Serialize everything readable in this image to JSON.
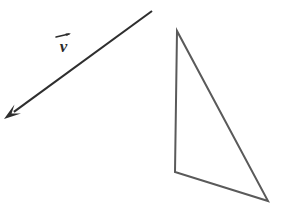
{
  "figure": {
    "background_color": "#ffffff",
    "width": 282,
    "height": 215,
    "vector": {
      "name": "v",
      "label_text": "v",
      "label_accent": "right-arrow-overbar",
      "label_position": {
        "x": 55,
        "y": 31
      },
      "tail": {
        "x": 152,
        "y": 11
      },
      "head": {
        "x": 4,
        "y": 119
      },
      "stroke_color": "#2e2e2e",
      "stroke_width": 2.1,
      "arrowhead": "solid-filled-triangle",
      "arrowhead_length": 17,
      "arrowhead_width": 11
    },
    "triangle": {
      "name": "triangle",
      "stroke_color": "#5a5a5a",
      "stroke_width": 2.0,
      "fill": "none",
      "vertices": [
        {
          "label": "top",
          "x": 177,
          "y": 31
        },
        {
          "label": "bottom-left",
          "x": 175,
          "y": 172
        },
        {
          "label": "bottom-right",
          "x": 268,
          "y": 201
        }
      ]
    }
  },
  "colors": {
    "background": "#ffffff",
    "vector_stroke": "#2e2e2e",
    "triangle_stroke": "#5a5a5a",
    "label_text": "#2b2b2b"
  }
}
